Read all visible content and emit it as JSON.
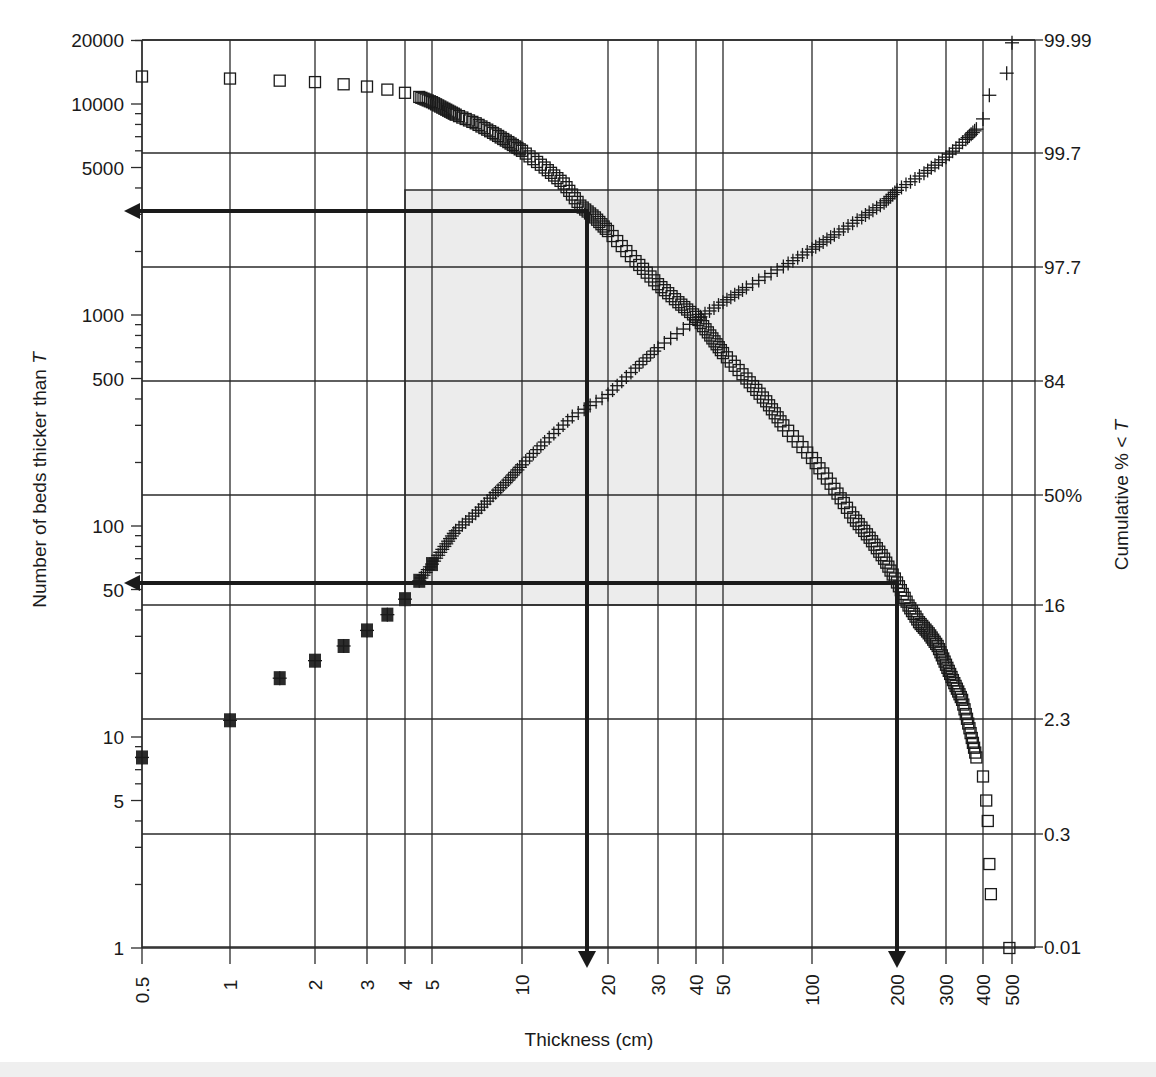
{
  "chart_data": {
    "type": "scatter",
    "title": "",
    "xlabel": "Thickness (cm)",
    "ylabel_left": "Number of beds thicker than T",
    "ylabel_right": "Cumulative % < T",
    "x_scale": "log",
    "y_left_scale": "log",
    "y_right_scale": "probability",
    "xlim": [
      0.5,
      600
    ],
    "ylim_left": [
      1,
      20000
    ],
    "x_ticks": [
      "0.5",
      "1",
      "2",
      "3",
      "4",
      "5",
      "10",
      "20",
      "30",
      "40",
      "50",
      "100",
      "200",
      "300",
      "400",
      "500"
    ],
    "y_left_ticks": [
      "20000",
      "10000",
      "5000",
      "1000",
      "500",
      "100",
      "50",
      "10",
      "5",
      "1"
    ],
    "y_right_ticks": [
      "99.99",
      "99.7",
      "97.7",
      "84",
      "50%",
      "16",
      "2.3",
      "0.3",
      "0.01"
    ],
    "grid": true,
    "series": [
      {
        "name": "Number of beds thicker than T",
        "marker": "open-square",
        "axis": "left",
        "points": [
          [
            0.5,
            13500
          ],
          [
            1,
            13200
          ],
          [
            1.5,
            12900
          ],
          [
            2,
            12700
          ],
          [
            2.5,
            12400
          ],
          [
            3,
            12100
          ],
          [
            3.5,
            11700
          ],
          [
            4,
            11300
          ],
          [
            4.5,
            10800
          ],
          [
            5,
            10200
          ],
          [
            5.5,
            9500
          ],
          [
            6,
            8900
          ],
          [
            7,
            8100
          ],
          [
            8,
            7300
          ],
          [
            9,
            6600
          ],
          [
            10,
            6000
          ],
          [
            12,
            5000
          ],
          [
            14,
            4200
          ],
          [
            16,
            3300
          ],
          [
            18,
            2900
          ],
          [
            20,
            2500
          ],
          [
            25,
            1800
          ],
          [
            30,
            1400
          ],
          [
            35,
            1150
          ],
          [
            40,
            980
          ],
          [
            45,
            800
          ],
          [
            50,
            660
          ],
          [
            60,
            500
          ],
          [
            70,
            390
          ],
          [
            80,
            300
          ],
          [
            100,
            210
          ],
          [
            120,
            150
          ],
          [
            140,
            110
          ],
          [
            160,
            88
          ],
          [
            180,
            70
          ],
          [
            200,
            54
          ],
          [
            220,
            42
          ],
          [
            240,
            35
          ],
          [
            260,
            31
          ],
          [
            280,
            27
          ],
          [
            300,
            22
          ],
          [
            320,
            18
          ],
          [
            340,
            15
          ],
          [
            360,
            11
          ],
          [
            380,
            8
          ],
          [
            400,
            6.5
          ],
          [
            410,
            5
          ],
          [
            415,
            4
          ],
          [
            420,
            2.5
          ],
          [
            425,
            1.8
          ],
          [
            490,
            1
          ]
        ]
      },
      {
        "name": "Cumulative % < T",
        "marker": "plus",
        "axis": "right",
        "points_left_equivalent": [
          [
            0.5,
            8
          ],
          [
            1,
            12
          ],
          [
            1.5,
            19
          ],
          [
            2,
            23
          ],
          [
            2.5,
            27
          ],
          [
            3,
            32
          ],
          [
            3.5,
            38
          ],
          [
            4,
            45
          ],
          [
            4.5,
            55
          ],
          [
            5,
            66
          ],
          [
            5.5,
            80
          ],
          [
            6,
            95
          ],
          [
            7,
            115
          ],
          [
            8,
            140
          ],
          [
            9,
            165
          ],
          [
            10,
            195
          ],
          [
            12,
            250
          ],
          [
            15,
            330
          ],
          [
            20,
            420
          ],
          [
            25,
            560
          ],
          [
            30,
            700
          ],
          [
            40,
            950
          ],
          [
            50,
            1150
          ],
          [
            60,
            1350
          ],
          [
            80,
            1700
          ],
          [
            100,
            2050
          ],
          [
            120,
            2400
          ],
          [
            150,
            2900
          ],
          [
            180,
            3400
          ],
          [
            200,
            3900
          ],
          [
            250,
            4700
          ],
          [
            300,
            5600
          ],
          [
            350,
            6800
          ],
          [
            380,
            7600
          ],
          [
            400,
            8500
          ],
          [
            420,
            11000
          ],
          [
            480,
            14000
          ],
          [
            500,
            19500
          ]
        ]
      }
    ],
    "annotations": {
      "shaded_box": {
        "x_range": [
          4,
          200
        ],
        "y_left_range": [
          42,
          3900
        ],
        "label": "16–84 percentile band"
      },
      "arrows": [
        {
          "from_T": 17,
          "to": "left-axis",
          "y_left": 2800,
          "direction": "left"
        },
        {
          "from_T": 17,
          "to": "x-axis",
          "direction": "down"
        },
        {
          "from_T": 200,
          "to": "left-axis",
          "y_left": 55,
          "direction": "left"
        },
        {
          "from_T": 200,
          "to": "x-axis",
          "direction": "down"
        }
      ]
    }
  },
  "labels": {
    "xlabel": "Thickness (cm)",
    "ylabel_left_prefix": "Number of beds thicker than ",
    "ylabel_left_var": "T",
    "ylabel_right_prefix": "Cumulative % < ",
    "ylabel_right_var": "T"
  },
  "colors": {
    "ink": "#1a1a1a",
    "grid": "#2a2a2a",
    "shade": "#ececec",
    "background": "#ffffff"
  }
}
